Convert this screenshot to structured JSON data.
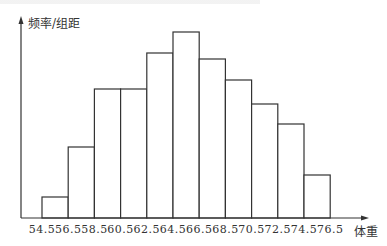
{
  "chart_data": {
    "type": "bar",
    "subtype": "histogram",
    "title": "",
    "ylabel": "频率/组距",
    "xlabel": "体重",
    "bin_edges": [
      54.5,
      56.5,
      58.5,
      60.5,
      62.5,
      64.5,
      66.5,
      68.5,
      70.5,
      72.5,
      74.5,
      76.5
    ],
    "categories": [
      "54.5-56.5",
      "56.5-58.5",
      "58.5-60.5",
      "60.5-62.5",
      "62.5-64.5",
      "64.5-66.5",
      "66.5-68.5",
      "68.5-70.5",
      "70.5-72.5",
      "72.5-74.5",
      "74.5-76.5"
    ],
    "values": [
      21,
      71,
      129,
      129,
      165,
      186,
      159,
      138,
      114,
      94,
      43
    ],
    "value_units": "relative bar height (no y-axis ticks shown)",
    "grid": false,
    "legend": null
  },
  "axes": {
    "y_label": "频率/组距",
    "x_label": "体重",
    "x_ticks": [
      "54.5",
      "56.5",
      "58.5",
      "60.5",
      "62.5",
      "64.5",
      "66.5",
      "68.5",
      "70.5",
      "72.5",
      "74.5",
      "76.5"
    ]
  },
  "colors": {
    "stroke": "#333333",
    "fill": "#ffffff"
  }
}
